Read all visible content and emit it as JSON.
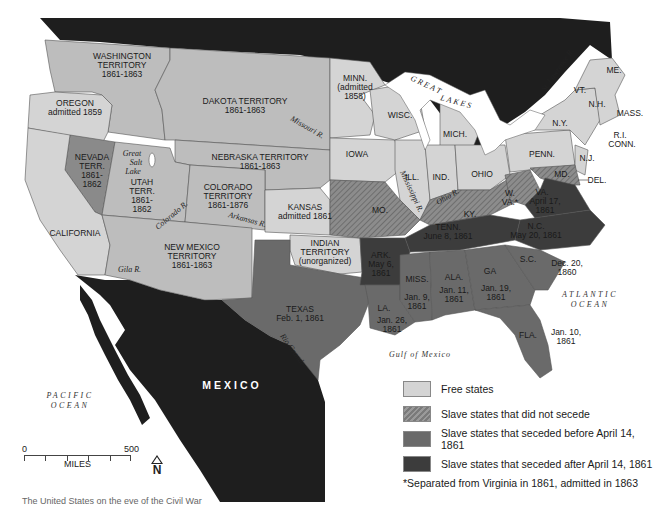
{
  "map": {
    "colors": {
      "water": "#ffffff",
      "foreign": "#1e1e1e",
      "territory": "#bdbdbd",
      "free_state": "#d4d4d4",
      "border_state": "#8c8c8c",
      "lower_south": "#6a6a6a",
      "upper_south": "#3c3c3c",
      "boundary": "#555555"
    },
    "countries": {
      "canada": "CANADA",
      "mexico": "MEXICO"
    },
    "oceans": {
      "pacific_line1": "PACIFIC",
      "pacific_line2": "OCEAN",
      "atlantic_line1": "ATLANTIC",
      "atlantic_line2": "OCEAN",
      "gulf": "Gulf of Mexico"
    },
    "water_labels": {
      "great_lakes_1": "GREAT",
      "great_lakes_2": "LAKES",
      "great_salt_lake_1": "Great",
      "great_salt_lake_2": "Salt",
      "great_salt_lake_3": "Lake"
    },
    "rivers": {
      "missouri": "Missouri R.",
      "mississippi": "Mississippi R.",
      "ohio": "Ohio R.",
      "st_lawrence": "St. Lawrence R.",
      "colorado": "Colorado R.",
      "arkansas": "Arkansas R.",
      "gila": "Gila R.",
      "rio_grande": "Rio Grande"
    },
    "regions": {
      "washington": [
        "WASHINGTON",
        "TERRITORY",
        "1861-1863"
      ],
      "oregon": [
        "OREGON",
        "admitted 1859"
      ],
      "dakota": [
        "DAKOTA TERRITORY",
        "1861-1863"
      ],
      "minnesota": [
        "MINN.",
        "(admitted",
        "1858)"
      ],
      "nebraska": [
        "NEBRASKA TERRITORY",
        "1861-1863"
      ],
      "nevada": [
        "NEVADA",
        "TERR.",
        "1861-",
        "1862"
      ],
      "utah": [
        "UTAH",
        "TERR.",
        "1861-",
        "1862"
      ],
      "colorado": [
        "COLORADO",
        "TERRITORY",
        "1861-1876"
      ],
      "kansas": [
        "KANSAS",
        "admitted 1861"
      ],
      "california": [
        "CALIFORNIA"
      ],
      "new_mexico": [
        "NEW MEXICO",
        "TERRITORY",
        "1861-1863"
      ],
      "indian_territory": [
        "INDIAN",
        "TERRITORY",
        "(unorganized)"
      ],
      "texas": [
        "TEXAS",
        "Feb. 1, 1861"
      ],
      "iowa": [
        "IOWA"
      ],
      "wisconsin": [
        "WISC."
      ],
      "michigan": [
        "MICH."
      ],
      "illinois": [
        "ILL."
      ],
      "indiana": [
        "IND."
      ],
      "ohio": [
        "OHIO"
      ],
      "pennsylvania": [
        "PENN."
      ],
      "new_york": [
        "N.Y."
      ],
      "new_jersey": [
        "N.J."
      ],
      "maine": [
        "ME."
      ],
      "vermont": [
        "VT."
      ],
      "new_hampshire": [
        "N.H."
      ],
      "massachusetts": [
        "MASS."
      ],
      "ri_conn": [
        "R.I.",
        "CONN."
      ],
      "delaware": [
        "DEL."
      ],
      "maryland": [
        "MD."
      ],
      "missouri": [
        "MO."
      ],
      "kentucky": [
        "KY."
      ],
      "west_virginia": [
        "W.",
        "VA.*"
      ],
      "virginia": [
        "VA.",
        "April 17,",
        "1861"
      ],
      "north_carolina": [
        "N.C.",
        "May 20, 1861"
      ],
      "tennessee": [
        "TENN.",
        "June 8, 1861"
      ],
      "arkansas": [
        "ARK.",
        "May 6,",
        "1861"
      ],
      "south_carolina": [
        "S.C.",
        "Dec. 20,",
        "1860"
      ],
      "georgia": [
        "GA",
        "Jan. 19,",
        "1861"
      ],
      "alabama": [
        "ALA.",
        "Jan. 11,",
        "1861"
      ],
      "mississippi": [
        "MISS.",
        "Jan. 9,",
        "1861"
      ],
      "louisiana": [
        "LA.",
        "Jan. 26,",
        "1861"
      ],
      "florida": [
        "FLA.",
        "Jan. 10,",
        "1861"
      ]
    }
  },
  "legend": {
    "items": [
      {
        "label": "Free states",
        "swatch": "free"
      },
      {
        "label": "Slave states that did not secede",
        "swatch": "border"
      },
      {
        "label": "Slave states that seceded before April 14, 1861",
        "swatch": "lower"
      },
      {
        "label": "Slave states that seceded after April 14, 1861",
        "swatch": "upper"
      }
    ],
    "note": "*Separated from Virginia in 1861, admitted in 1863"
  },
  "scale": {
    "min": "0",
    "max": "500",
    "unit": "MILES"
  },
  "north": "N",
  "caption": "The United States on the eve of the Civil War"
}
